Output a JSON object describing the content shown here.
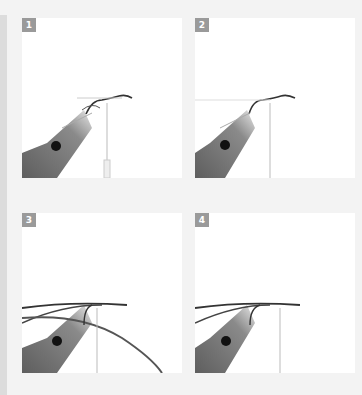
{
  "steps": [
    {
      "number": "1",
      "description": "Hook in vise with thread attached, fine fibers tied in at bend"
    },
    {
      "number": "2",
      "description": "Fibers trimmed and secured along shank"
    },
    {
      "number": "3",
      "description": "Long quill/feather strands tied in extending past vise"
    },
    {
      "number": "4",
      "description": "Strands secured along shank, ready to wrap"
    }
  ],
  "colors": {
    "background": "#f3f3f3",
    "panel": "#ffffff",
    "badge": "#9a9a9a",
    "vise": "#6e6e6e"
  }
}
